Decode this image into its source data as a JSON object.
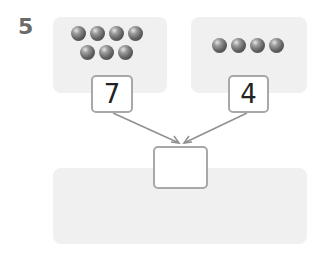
{
  "question": {
    "number": "5",
    "left": {
      "ball_count": 7,
      "rows": [
        4,
        3
      ],
      "label": "7"
    },
    "right": {
      "ball_count": 4,
      "rows": [
        4
      ],
      "label": "4"
    },
    "answer": {
      "value": ""
    }
  },
  "colors": {
    "panel": "#f0f0f0",
    "box_border": "#a8a8a8",
    "arrow": "#909090",
    "number": "#6a6a6a"
  }
}
